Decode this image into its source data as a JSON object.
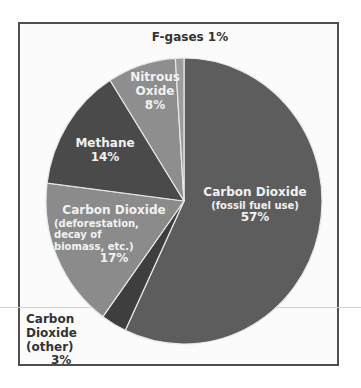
{
  "chart_data": {
    "type": "pie",
    "title": "",
    "start_angle": "top, clockwise",
    "slices": [
      {
        "label": "Carbon Dioxide (fossil fuel use)",
        "value": 57,
        "color": "#5d5d5d"
      },
      {
        "label": "Carbon Dioxide (other)",
        "value": 3,
        "color": "#3e3e3e"
      },
      {
        "label": "Carbon Dioxide (deforestation, decay of biomass, etc.)",
        "value": 17,
        "color": "#8b8b8b"
      },
      {
        "label": "Methane",
        "value": 14,
        "color": "#4a4a4a"
      },
      {
        "label": "Nitrous Oxide",
        "value": 8,
        "color": "#8e8e8e"
      },
      {
        "label": "F-gases",
        "value": 1,
        "color": "#9c9c9c"
      }
    ]
  },
  "labels": {
    "co2_fossil": {
      "title": "Carbon Dioxide",
      "sub": "(fossil fuel use)",
      "pct": "57%"
    },
    "co2_other": {
      "line1": "Carbon",
      "line2": "Dioxide (other)",
      "pct": "3%"
    },
    "co2_defor": {
      "title": "Carbon Dioxide",
      "sub1": "(deforestation, decay of",
      "sub2": "biomass, etc.)",
      "pct": "17%"
    },
    "methane": {
      "title": "Methane",
      "pct": "14%"
    },
    "nitrous": {
      "line1": "Nitrous",
      "line2": "Oxide",
      "pct": "8%"
    },
    "fgases": {
      "text": "F-gases 1%"
    }
  }
}
